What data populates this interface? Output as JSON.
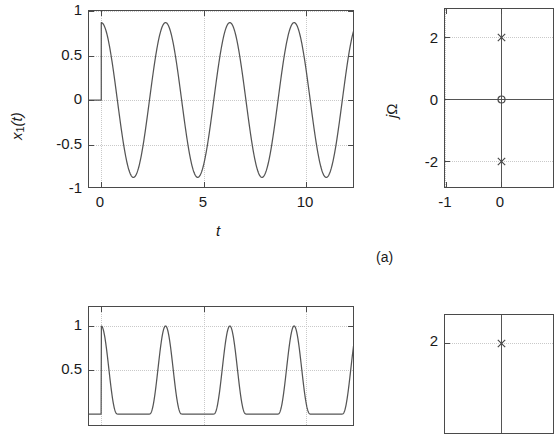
{
  "figure": {
    "caption_a": "(a)"
  },
  "panel_a_time": {
    "y_axis_title": "x",
    "y_axis_title_sub": "1",
    "y_axis_title_paren": "(t)",
    "x_axis_title": "t",
    "y_ticks": [
      "1",
      "0.5",
      "0",
      "-0.5",
      "-1"
    ],
    "x_ticks": [
      "0",
      "5",
      "10"
    ]
  },
  "panel_a_pz": {
    "y_axis_title_j": "j",
    "y_axis_title_omega": "Ω",
    "y_ticks": [
      "2",
      "0",
      "-2"
    ],
    "x_ticks": [
      "-1",
      "0"
    ],
    "pole_symbol": "x",
    "zero_symbol": "o"
  },
  "panel_b_time": {
    "y_ticks": [
      "1",
      "0.5"
    ]
  },
  "panel_b_pz": {
    "y_ticks": [
      "2"
    ]
  },
  "chart_data": [
    {
      "type": "line",
      "name": "x1(t) time-domain causal cosine",
      "title": "",
      "xlabel": "t",
      "ylabel": "x_1(t)",
      "xlim": [
        -0.6,
        12.4
      ],
      "ylim": [
        -1.15,
        1.15
      ],
      "xticks": [
        0,
        5,
        10
      ],
      "yticks": [
        -1,
        -0.5,
        0,
        0.5,
        1
      ],
      "grid": true,
      "description": "x1(t) = cos(2t)u(t): zero for t<0, then unit-amplitude cosine of angular frequency 2 rad/s (period pi ~ 3.14) for t>=0",
      "series": [
        {
          "name": "x1(t)",
          "expression": "cos(2*t)*u(t)",
          "omega": 2.0,
          "amplitude": 1.0,
          "period": 3.14159,
          "t_start": -0.6,
          "t_end": 12.4,
          "peaks_t": [
            0,
            3.14,
            6.28,
            9.42,
            12.27
          ],
          "troughs_t": [
            1.57,
            4.71,
            7.85,
            10.99
          ]
        }
      ]
    },
    {
      "type": "scatter",
      "name": "s-plane pole-zero diagram (a)",
      "title": "",
      "xlabel": "σ",
      "ylabel": "jΩ",
      "xlim": [
        -1.55,
        0.85
      ],
      "ylim": [
        -3.2,
        3.2
      ],
      "xticks": [
        -1,
        0
      ],
      "yticks": [
        -2,
        0,
        2
      ],
      "grid": true,
      "poles": [
        {
          "re": 0,
          "im": 2,
          "marker": "x"
        },
        {
          "re": 0,
          "im": -2,
          "marker": "x"
        }
      ],
      "zeros": [
        {
          "re": 0,
          "im": 0,
          "marker": "o"
        }
      ]
    },
    {
      "type": "line",
      "name": "panel (b) time-domain rectified pulse train (partially visible)",
      "xlabel": "t",
      "ylabel": "",
      "yticks": [
        1,
        0.5
      ],
      "grid": true,
      "description": "Half-wave style narrow positive pulses repeating with the same period pi",
      "series": [
        {
          "name": "x2(t)",
          "peaks_t": [
            0,
            3.14,
            6.28,
            9.42,
            12.27
          ],
          "amplitude": 1.0
        }
      ]
    },
    {
      "type": "scatter",
      "name": "s-plane pole-zero diagram (b) (partially visible)",
      "ylabel": "jΩ",
      "yticks": [
        2
      ],
      "poles": [
        {
          "re": 0,
          "im": 2,
          "marker": "x"
        }
      ]
    }
  ]
}
